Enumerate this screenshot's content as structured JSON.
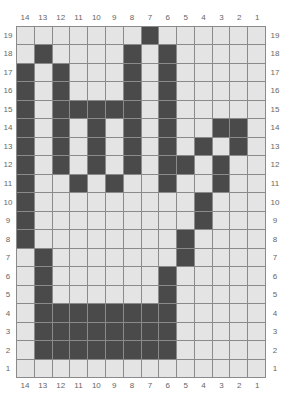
{
  "chart": {
    "columns": [
      14,
      13,
      12,
      11,
      10,
      9,
      8,
      7,
      6,
      5,
      4,
      3,
      2,
      1
    ],
    "rows": [
      19,
      18,
      17,
      16,
      15,
      14,
      13,
      12,
      11,
      10,
      9,
      8,
      7,
      6,
      5,
      4,
      3,
      2,
      1
    ],
    "colors": {
      "filled": "#4a4a4a",
      "empty": "#e4e4e4",
      "gridline": "#8a8a8a",
      "label": "#666666"
    },
    "filled_cells": {
      "19": [
        7
      ],
      "18": [
        13,
        8,
        6
      ],
      "17": [
        14,
        12,
        8,
        6
      ],
      "16": [
        14,
        12,
        8,
        6
      ],
      "15": [
        14,
        12,
        11,
        10,
        9,
        8,
        6
      ],
      "14": [
        14,
        12,
        10,
        8,
        6,
        3,
        2
      ],
      "13": [
        14,
        12,
        10,
        8,
        6,
        4,
        2
      ],
      "12": [
        14,
        12,
        10,
        8,
        6,
        5,
        3
      ],
      "11": [
        14,
        11,
        9,
        6,
        3
      ],
      "10": [
        14,
        4
      ],
      "9": [
        14,
        4
      ],
      "8": [
        14,
        5
      ],
      "7": [
        13,
        5
      ],
      "6": [
        13,
        6
      ],
      "5": [
        13,
        6
      ],
      "4": [
        13,
        12,
        11,
        10,
        9,
        8,
        7,
        6
      ],
      "3": [
        13,
        12,
        11,
        10,
        9,
        8,
        7,
        6
      ],
      "2": [
        13,
        12,
        11,
        10,
        9,
        8,
        7,
        6
      ],
      "1": []
    }
  }
}
